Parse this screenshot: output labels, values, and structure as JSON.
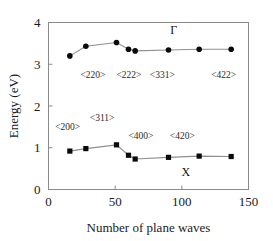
{
  "chart_data": {
    "type": "line",
    "title": "",
    "xlabel": "Number of plane waves",
    "ylabel": "Energy (eV)",
    "xlim": [
      0,
      150
    ],
    "ylim": [
      0,
      4
    ],
    "xticks": [
      0,
      50,
      100,
      150
    ],
    "yticks": [
      0,
      1,
      2,
      3,
      4
    ],
    "xtick_labels": [
      "0",
      "50",
      "100",
      "150"
    ],
    "ytick_labels": [
      "0",
      "1",
      "2",
      "3",
      "4"
    ],
    "grid": false,
    "legend_position": "inline-annotations",
    "series": [
      {
        "name": "Γ",
        "marker": "filled-circle",
        "x": [
          16,
          28,
          51,
          60,
          65,
          90,
          113,
          137
        ],
        "values": [
          3.2,
          3.43,
          3.52,
          3.36,
          3.32,
          3.34,
          3.36,
          3.36
        ]
      },
      {
        "name": "X",
        "marker": "filled-square",
        "x": [
          16,
          28,
          51,
          60,
          65,
          90,
          113,
          137
        ],
        "values": [
          0.92,
          0.98,
          1.07,
          0.82,
          0.73,
          0.77,
          0.8,
          0.79
        ]
      }
    ],
    "series_labels": [
      {
        "text": "Γ",
        "x": 94,
        "y": 3.72
      },
      {
        "text": "X",
        "x": 103,
        "y": 0.32
      }
    ],
    "annotations": [
      {
        "text": "<220>",
        "x": 24,
        "y": 2.67
      },
      {
        "text": "<222>",
        "x": 51,
        "y": 2.67
      },
      {
        "text": "<331>",
        "x": 76,
        "y": 2.67
      },
      {
        "text": "<422>",
        "x": 122,
        "y": 2.67
      },
      {
        "text": "<200>",
        "x": 5,
        "y": 1.43
      },
      {
        "text": "<311>",
        "x": 31,
        "y": 1.64
      },
      {
        "text": "<400>",
        "x": 60,
        "y": 1.2
      },
      {
        "text": "<420>",
        "x": 91,
        "y": 1.2
      }
    ]
  },
  "colors": {
    "marker": "#0a0a0a",
    "line": "#8f8f8f",
    "frame": "#8a8a8a",
    "text": "#1a1a1a",
    "background": "#ffffff"
  }
}
